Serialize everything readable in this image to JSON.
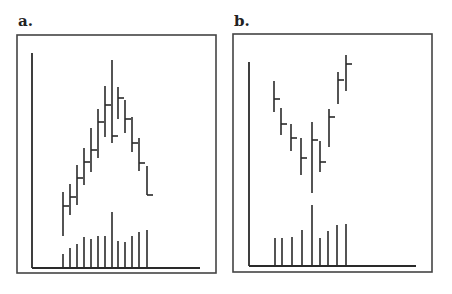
{
  "panels": [
    {
      "label": "a.",
      "frame": {
        "x": 17,
        "y": 35,
        "w": 199,
        "h": 238
      },
      "axes": {
        "x0": 32,
        "y_top": 53,
        "y_base": 268,
        "x_end": 200
      },
      "pattern": "inverted V (top reversal) with volume peak at apex",
      "price_bars": [
        {
          "x": 63,
          "high": 192,
          "low": 236,
          "close": 206
        },
        {
          "x": 70,
          "high": 184,
          "low": 215,
          "close": 197
        },
        {
          "x": 77,
          "high": 165,
          "low": 205,
          "close": 178
        },
        {
          "x": 84,
          "high": 148,
          "low": 185,
          "close": 162
        },
        {
          "x": 91,
          "high": 128,
          "low": 172,
          "close": 150
        },
        {
          "x": 98,
          "high": 109,
          "low": 158,
          "close": 122
        },
        {
          "x": 105,
          "high": 86,
          "low": 137,
          "close": 105
        },
        {
          "x": 112,
          "high": 60,
          "low": 143,
          "close": 136
        },
        {
          "x": 118,
          "high": 87,
          "low": 119,
          "close": 98
        },
        {
          "x": 125,
          "high": 100,
          "low": 133,
          "close": 119
        },
        {
          "x": 132,
          "high": 117,
          "low": 152,
          "close": 143
        },
        {
          "x": 139,
          "high": 138,
          "low": 171,
          "close": 163
        },
        {
          "x": 147,
          "high": 166,
          "low": 195,
          "close": 195
        }
      ],
      "volume_bars": [
        {
          "x": 63,
          "top": 254
        },
        {
          "x": 70,
          "top": 248
        },
        {
          "x": 77,
          "top": 244
        },
        {
          "x": 84,
          "top": 237
        },
        {
          "x": 91,
          "top": 239
        },
        {
          "x": 98,
          "top": 236
        },
        {
          "x": 105,
          "top": 236
        },
        {
          "x": 112,
          "top": 212
        },
        {
          "x": 118,
          "top": 241
        },
        {
          "x": 125,
          "top": 242
        },
        {
          "x": 132,
          "top": 236
        },
        {
          "x": 139,
          "top": 232
        },
        {
          "x": 147,
          "top": 230
        }
      ]
    },
    {
      "label": "b.",
      "frame": {
        "x": 233,
        "y": 34,
        "w": 199,
        "h": 238
      },
      "axes": {
        "x0": 249,
        "y_top": 62,
        "y_base": 266,
        "x_end": 416
      },
      "pattern": "V bottom (bottom reversal) with volume peak at low",
      "price_bars": [
        {
          "x": 274,
          "high": 81,
          "low": 112,
          "close": 99
        },
        {
          "x": 281,
          "high": 108,
          "low": 135,
          "close": 124
        },
        {
          "x": 291,
          "high": 124,
          "low": 151,
          "close": 138
        },
        {
          "x": 301,
          "high": 138,
          "low": 175,
          "close": 158
        },
        {
          "x": 312,
          "high": 122,
          "low": 193,
          "close": 140
        },
        {
          "x": 320,
          "high": 141,
          "low": 172,
          "close": 162
        },
        {
          "x": 329,
          "high": 109,
          "low": 147,
          "close": 117
        },
        {
          "x": 338,
          "high": 72,
          "low": 104,
          "close": 80
        },
        {
          "x": 346,
          "high": 55,
          "low": 91,
          "close": 64
        }
      ],
      "volume_bars": [
        {
          "x": 275,
          "top": 238
        },
        {
          "x": 282,
          "top": 238
        },
        {
          "x": 292,
          "top": 237
        },
        {
          "x": 302,
          "top": 230
        },
        {
          "x": 312,
          "top": 205
        },
        {
          "x": 320,
          "top": 238
        },
        {
          "x": 328,
          "top": 231
        },
        {
          "x": 337,
          "top": 225
        },
        {
          "x": 346,
          "top": 224
        }
      ]
    }
  ],
  "chart_data": [
    {
      "type": "bar",
      "title": "a.",
      "subtype": "OHLC bar chart with volume",
      "xlabel": "",
      "ylabel": "",
      "grid": false,
      "categories": [
        1,
        2,
        3,
        4,
        5,
        6,
        7,
        8,
        9,
        10,
        11,
        12,
        13
      ],
      "series": [
        {
          "name": "high",
          "values": [
            19,
            23,
            27,
            31,
            35,
            38,
            43,
            48,
            43,
            40,
            37,
            33,
            27
          ]
        },
        {
          "name": "low",
          "values": [
            9,
            14,
            15,
            19,
            22,
            25,
            29,
            28,
            35,
            31,
            29,
            25,
            21
          ]
        },
        {
          "name": "close",
          "values": [
            15,
            17,
            24,
            27,
            29,
            34,
            40,
            30,
            40,
            35,
            31,
            27,
            21
          ]
        },
        {
          "name": "volume",
          "values": [
            3,
            4,
            5,
            7,
            6,
            7,
            7,
            12,
            6,
            6,
            7,
            8,
            8
          ]
        }
      ]
    },
    {
      "type": "bar",
      "title": "b.",
      "subtype": "OHLC bar chart with volume",
      "xlabel": "",
      "ylabel": "",
      "grid": false,
      "categories": [
        1,
        2,
        3,
        4,
        5,
        6,
        7,
        8,
        9
      ],
      "series": [
        {
          "name": "high",
          "values": [
            41,
            36,
            33,
            30,
            34,
            30,
            36,
            44,
            47
          ]
        },
        {
          "name": "low",
          "values": [
            34,
            29,
            25,
            21,
            17,
            21,
            27,
            35,
            38
          ]
        },
        {
          "name": "close",
          "values": [
            37,
            32,
            30,
            26,
            30,
            25,
            34,
            42,
            45
          ]
        },
        {
          "name": "volume",
          "values": [
            6,
            6,
            6,
            7,
            12,
            6,
            7,
            8,
            8
          ]
        }
      ]
    }
  ]
}
